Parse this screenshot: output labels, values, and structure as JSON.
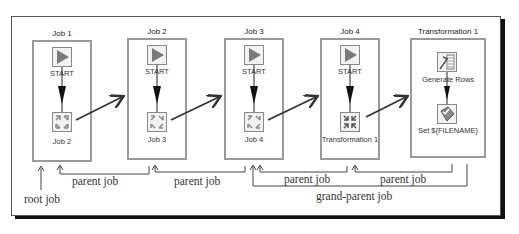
{
  "diagram": {
    "boxes": [
      {
        "title": "Job 1",
        "start_label": "START",
        "entry_label": "Job 2"
      },
      {
        "title": "Job 2",
        "start_label": "START",
        "entry_label": "Job 3"
      },
      {
        "title": "Job 3",
        "start_label": "START",
        "entry_label": "Job 4"
      },
      {
        "title": "Job 4",
        "start_label": "START",
        "entry_label": "Transformation 1"
      },
      {
        "title": "Transformation 1",
        "step1_label": "Generate Rows",
        "step2_label": "Set ${FILENAME}"
      }
    ],
    "annotations": {
      "root_job": "root job",
      "parent_job_1": "parent job",
      "parent_job_2": "parent job",
      "parent_job_3": "parent job",
      "parent_job_4": "parent job",
      "grand_parent_job": "grand-parent job"
    },
    "colors": {
      "box_border": "#9a9a9a",
      "start_triangle": "#7a7a7a",
      "arrow": "#333333",
      "shadow": "#111111"
    }
  }
}
